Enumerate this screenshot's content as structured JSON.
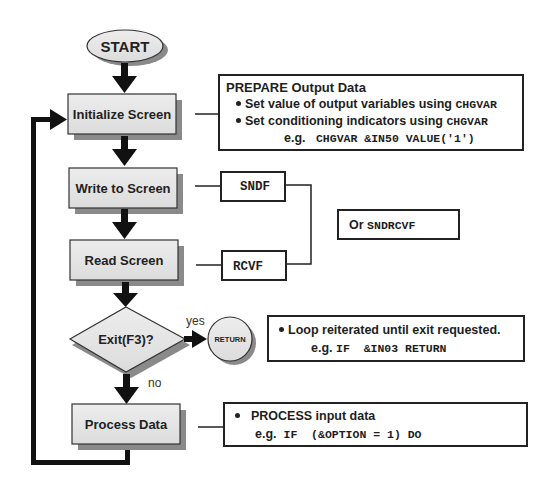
{
  "diagram": {
    "start": {
      "label": "START"
    },
    "steps": [
      {
        "id": "initialize",
        "label": "Initialize Screen"
      },
      {
        "id": "write",
        "label": "Write to Screen"
      },
      {
        "id": "read",
        "label": "Read Screen"
      },
      {
        "id": "process",
        "label": "Process Data"
      }
    ],
    "decision": {
      "label": "Exit(F3)?",
      "yes_label": "yes",
      "no_label": "no"
    },
    "terminal_return": {
      "label": "RETURN"
    },
    "notes": {
      "prepare": {
        "title": "PREPARE Output Data",
        "bullet1_text": "Set value of output variables using ",
        "bullet1_code": "CHGVAR",
        "bullet2_text": "Set conditioning indicators using ",
        "bullet2_code": "CHGVAR",
        "example_prefix": "e.g.",
        "example_code": "CHGVAR &IN50 VALUE('1')"
      },
      "sndf": {
        "label": "SNDF"
      },
      "rcvf": {
        "label": "RCVF"
      },
      "sndrcvf": {
        "prefix": "Or",
        "code": "SNDRCVF"
      },
      "loop": {
        "bullet_text": "Loop reiterated until exit requested.",
        "example_prefix": "e.g.",
        "example_code": "IF  &IN03 RETURN"
      },
      "process": {
        "bullet_text": "PROCESS input data",
        "example_prefix": "e.g.",
        "example_code": "IF  (&OPTION = 1) DO"
      }
    },
    "colors": {
      "box_fill": "#e4e4e4",
      "shadow": "#8a8a8a",
      "stroke": "#222222",
      "arrow": "#111111"
    }
  }
}
